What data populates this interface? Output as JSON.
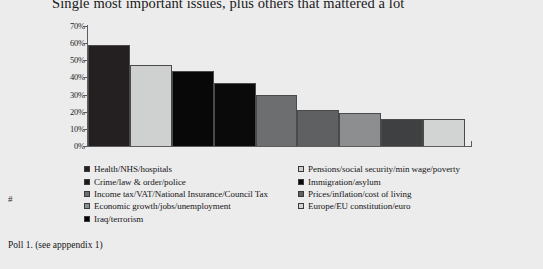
{
  "chart_data": {
    "type": "bar",
    "title": "Single most important issues, plus others that mattered a lot",
    "xlabel": "",
    "ylabel": "",
    "ylim": [
      0,
      70
    ],
    "ytick_labels": [
      "70%",
      "60%",
      "50%",
      "40%",
      "30%",
      "20%",
      "10%",
      "0%"
    ],
    "ytick_values": [
      70,
      60,
      50,
      40,
      30,
      20,
      10,
      0
    ],
    "grid": false,
    "legend_position": "below",
    "categories": [
      "Health/NHS/hospitals",
      "Pensions/social security/min wage/poverty",
      "Crime/law & order/police",
      "Immigration/asylum",
      "Income tax/VAT/National Insurance/Council Tax",
      "Prices/inflation/cost of living",
      "Economic growth/jobs/unemployment",
      "Europe/EU constitution/euro",
      "Iraq/terrorism"
    ],
    "values": [
      59,
      47,
      44,
      37,
      30,
      21,
      19,
      16,
      16
    ],
    "bar_colors": [
      "#241f20",
      "#cfd0d0",
      "#080808",
      "#0a0a0a",
      "#6d6e70",
      "#5f6062",
      "#8d8e90",
      "#3f4042",
      "#d2d3d3"
    ],
    "last_bar_color": "#050505"
  },
  "legend": {
    "left_column": [
      {
        "label": "Health/NHS/hospitals",
        "swatch": "#241f20"
      },
      {
        "label": "Crime/law & order/police",
        "swatch": "#1b1b1b"
      },
      {
        "label": "Income tax/VAT/National Insurance/Council Tax",
        "swatch": "#6d6e70"
      },
      {
        "label": "Economic growth/jobs/unemployment",
        "swatch": "#8d8e90"
      },
      {
        "label": "Iraq/terrorism",
        "swatch": "#050505"
      }
    ],
    "right_column": [
      {
        "label": "Pensions/social security/min wage/poverty",
        "swatch": "#cfd0d0"
      },
      {
        "label": "Immigration/asylum",
        "swatch": "#0a0a0a"
      },
      {
        "label": "Prices/inflation/cost of living",
        "swatch": "#5f6062"
      },
      {
        "label": "Europe/EU constitution/euro",
        "swatch": "#d2d3d3"
      }
    ]
  },
  "footer": {
    "hash_mark": "#",
    "source_note": "Poll 1. (see apppendix 1)"
  }
}
